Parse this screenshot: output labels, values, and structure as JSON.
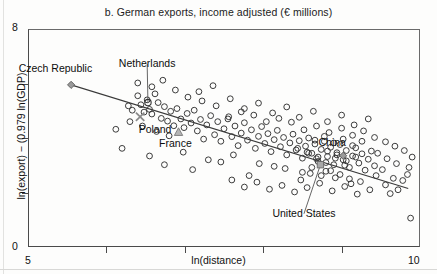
{
  "chart_data": {
    "type": "scatter",
    "title": "b. German exports, income adjusted (€ millions)",
    "xlabel": "ln(distance)",
    "ylabel": "ln(export) − (0.979 ln(GDP)",
    "xlim": [
      5,
      10
    ],
    "ylim": [
      0,
      8
    ],
    "xticks": [
      5,
      6,
      7,
      8,
      9,
      10
    ],
    "xtick_labels": [
      "5",
      "",
      "",
      "",
      "",
      "10"
    ],
    "yticks": [
      0,
      2,
      4,
      6,
      8
    ],
    "ytick_labels": [
      "0",
      "",
      "",
      "",
      "8"
    ],
    "grid": false,
    "legend": "none",
    "trendline": {
      "label": "fitted regression line",
      "x_start": 5.55,
      "y_start": 5.95,
      "x_end": 9.85,
      "y_end": 2.15
    },
    "annotations": [
      {
        "label": "Czech Republic",
        "marker": "diamond",
        "x": 5.55,
        "y": 5.95,
        "label_x": 5.35,
        "label_y": 6.55,
        "leader": false
      },
      {
        "label": "Netherlands",
        "marker": "circle",
        "x": 6.53,
        "y": 5.3,
        "label_x": 6.52,
        "label_y": 6.72,
        "leader": true
      },
      {
        "label": "Poland",
        "marker": "x",
        "x": 6.43,
        "y": 4.78,
        "label_x": 6.62,
        "label_y": 4.3,
        "leader": false
      },
      {
        "label": "France",
        "marker": "triangle",
        "x": 6.92,
        "y": 4.22,
        "label_x": 6.88,
        "label_y": 3.78,
        "leader": false
      },
      {
        "label": "China",
        "marker": "diamond",
        "x": 9.02,
        "y": 3.35,
        "label_x": 8.88,
        "label_y": 3.8,
        "leader": false
      },
      {
        "label": "United States",
        "marker": "square",
        "x": 8.73,
        "y": 3.02,
        "label_x": 8.52,
        "label_y": 1.22,
        "leader": true
      }
    ],
    "points": [
      [
        6.12,
        4.32
      ],
      [
        6.28,
        5.18
      ],
      [
        6.33,
        5.02
      ],
      [
        6.4,
        5.55
      ],
      [
        6.44,
        5.22
      ],
      [
        6.48,
        4.95
      ],
      [
        6.52,
        5.4
      ],
      [
        6.55,
        5.05
      ],
      [
        6.58,
        4.88
      ],
      [
        6.62,
        5.62
      ],
      [
        6.66,
        5.3
      ],
      [
        6.7,
        4.72
      ],
      [
        6.74,
        5.15
      ],
      [
        6.78,
        4.62
      ],
      [
        6.82,
        4.98
      ],
      [
        6.86,
        4.45
      ],
      [
        6.9,
        5.08
      ],
      [
        6.95,
        4.7
      ],
      [
        6.99,
        4.38
      ],
      [
        7.03,
        4.9
      ],
      [
        7.08,
        4.55
      ],
      [
        7.12,
        5.02
      ],
      [
        7.16,
        4.26
      ],
      [
        7.2,
        4.68
      ],
      [
        7.24,
        3.96
      ],
      [
        7.28,
        4.48
      ],
      [
        7.33,
        4.82
      ],
      [
        7.38,
        4.12
      ],
      [
        7.42,
        4.6
      ],
      [
        7.46,
        3.88
      ],
      [
        7.5,
        4.34
      ],
      [
        7.55,
        4.7
      ],
      [
        7.6,
        4.05
      ],
      [
        7.64,
        4.44
      ],
      [
        7.68,
        3.72
      ],
      [
        7.72,
        4.18
      ],
      [
        7.76,
        4.56
      ],
      [
        7.8,
        3.92
      ],
      [
        7.85,
        4.3
      ],
      [
        7.9,
        3.62
      ],
      [
        7.94,
        4.06
      ],
      [
        7.98,
        4.42
      ],
      [
        8.02,
        3.8
      ],
      [
        8.06,
        4.16
      ],
      [
        8.1,
        3.5
      ],
      [
        8.14,
        3.94
      ],
      [
        8.18,
        4.28
      ],
      [
        8.22,
        3.68
      ],
      [
        8.26,
        4.02
      ],
      [
        8.3,
        3.38
      ],
      [
        8.34,
        3.82
      ],
      [
        8.38,
        4.14
      ],
      [
        8.42,
        3.56
      ],
      [
        8.46,
        3.9
      ],
      [
        8.5,
        3.26
      ],
      [
        8.54,
        3.7
      ],
      [
        8.58,
        4.0
      ],
      [
        8.62,
        3.44
      ],
      [
        8.66,
        3.78
      ],
      [
        8.7,
        3.14
      ],
      [
        8.74,
        3.58
      ],
      [
        8.78,
        3.88
      ],
      [
        8.82,
        3.32
      ],
      [
        8.86,
        3.66
      ],
      [
        8.9,
        3.02
      ],
      [
        8.94,
        3.46
      ],
      [
        8.98,
        3.76
      ],
      [
        9.02,
        3.2
      ],
      [
        9.06,
        3.54
      ],
      [
        9.1,
        2.92
      ],
      [
        9.14,
        3.34
      ],
      [
        9.18,
        3.64
      ],
      [
        9.22,
        3.08
      ],
      [
        9.26,
        3.42
      ],
      [
        9.3,
        2.82
      ],
      [
        9.34,
        3.22
      ],
      [
        9.38,
        3.52
      ],
      [
        9.42,
        2.98
      ],
      [
        6.2,
        3.62
      ],
      [
        6.55,
        3.34
      ],
      [
        6.98,
        3.48
      ],
      [
        7.3,
        3.2
      ],
      [
        7.62,
        3.38
      ],
      [
        7.95,
        3.06
      ],
      [
        8.28,
        2.88
      ],
      [
        8.6,
        2.7
      ],
      [
        8.92,
        2.54
      ],
      [
        9.24,
        2.4
      ],
      [
        9.56,
        2.28
      ],
      [
        9.72,
        2.1
      ],
      [
        6.74,
        3.02
      ],
      [
        7.1,
        2.84
      ],
      [
        7.46,
        3.12
      ],
      [
        7.82,
        2.62
      ],
      [
        8.14,
        2.96
      ],
      [
        8.48,
        2.46
      ],
      [
        8.8,
        2.78
      ],
      [
        9.12,
        2.32
      ],
      [
        9.44,
        2.62
      ],
      [
        9.62,
        1.96
      ],
      [
        9.78,
        2.44
      ],
      [
        9.88,
        1.06
      ],
      [
        6.4,
        6.02
      ],
      [
        6.58,
        5.88
      ],
      [
        6.72,
        6.12
      ],
      [
        6.88,
        5.76
      ],
      [
        7.04,
        5.5
      ],
      [
        7.22,
        5.36
      ],
      [
        7.4,
        5.18
      ],
      [
        7.58,
        5.44
      ],
      [
        7.76,
        5.08
      ],
      [
        7.94,
        5.28
      ],
      [
        8.12,
        4.92
      ],
      [
        8.3,
        5.14
      ],
      [
        8.46,
        4.76
      ],
      [
        8.64,
        4.98
      ],
      [
        8.82,
        4.6
      ],
      [
        9.0,
        4.84
      ],
      [
        9.16,
        4.48
      ],
      [
        9.34,
        4.7
      ],
      [
        8.52,
        4.3
      ],
      [
        8.68,
        4.44
      ],
      [
        8.84,
        4.2
      ],
      [
        9.0,
        4.36
      ],
      [
        9.14,
        4.1
      ],
      [
        9.28,
        4.26
      ],
      [
        9.42,
        4.02
      ],
      [
        9.56,
        3.86
      ],
      [
        9.68,
        3.7
      ],
      [
        9.8,
        3.54
      ],
      [
        9.86,
        2.92
      ],
      [
        9.9,
        3.3
      ],
      [
        8.56,
        2.18
      ],
      [
        8.72,
        2.34
      ],
      [
        8.88,
        2.06
      ],
      [
        9.04,
        2.22
      ],
      [
        9.2,
        1.94
      ],
      [
        9.36,
        2.1
      ],
      [
        8.4,
        2.02
      ],
      [
        8.24,
        2.26
      ],
      [
        8.08,
        2.12
      ],
      [
        7.92,
        2.38
      ],
      [
        7.76,
        2.2
      ],
      [
        7.6,
        2.46
      ],
      [
        8.66,
        3.92
      ],
      [
        8.78,
        4.06
      ],
      [
        8.9,
        3.82
      ],
      [
        9.02,
        3.96
      ],
      [
        9.14,
        3.72
      ],
      [
        9.26,
        3.88
      ],
      [
        8.58,
        3.44
      ],
      [
        8.7,
        3.3
      ],
      [
        8.82,
        3.52
      ],
      [
        8.94,
        3.38
      ],
      [
        9.06,
        3.16
      ],
      [
        9.18,
        3.3
      ],
      [
        8.44,
        3.62
      ],
      [
        8.56,
        3.48
      ],
      [
        8.68,
        3.24
      ],
      [
        8.8,
        3.1
      ],
      [
        8.92,
        3.26
      ],
      [
        9.04,
        3.0
      ],
      [
        7.18,
        5.7
      ],
      [
        7.36,
        5.92
      ],
      [
        6.3,
        4.6
      ],
      [
        6.46,
        4.44
      ],
      [
        6.64,
        4.24
      ],
      [
        6.8,
        4.08
      ],
      [
        9.46,
        3.44
      ],
      [
        9.58,
        3.24
      ],
      [
        9.7,
        3.06
      ],
      [
        9.84,
        2.66
      ],
      [
        9.52,
        2.84
      ],
      [
        9.66,
        2.52
      ],
      [
        8.36,
        4.58
      ],
      [
        8.2,
        4.72
      ],
      [
        8.04,
        4.6
      ],
      [
        7.88,
        4.84
      ],
      [
        7.72,
        4.96
      ],
      [
        7.56,
        4.78
      ],
      [
        8.98,
        2.66
      ],
      [
        9.1,
        2.5
      ],
      [
        8.86,
        2.8
      ],
      [
        8.74,
        2.62
      ],
      [
        8.62,
        2.92
      ],
      [
        8.5,
        2.74
      ]
    ]
  }
}
